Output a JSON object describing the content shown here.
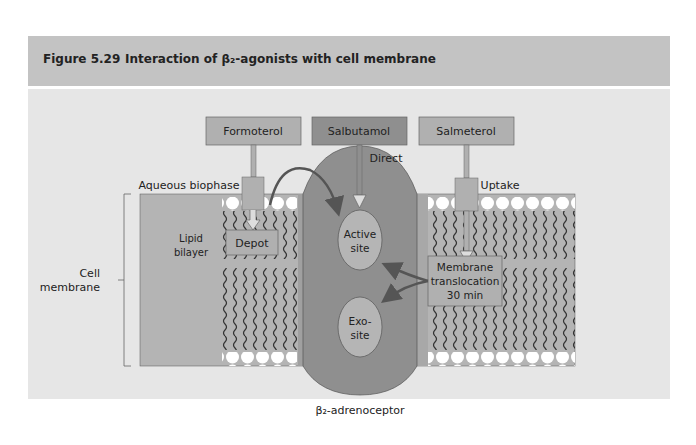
{
  "figure": {
    "number": "Figure 5.29",
    "title": "Interaction of β₂-agonists with cell membrane"
  },
  "diagram": {
    "drugs": [
      {
        "label": "Formoterol"
      },
      {
        "label": "Salbutamol"
      },
      {
        "label": "Salmeterol"
      }
    ],
    "labels": {
      "direct": "Direct",
      "uptake": "Uptake",
      "aqueous_biophase": "Aqueous biophase",
      "lipid": "Lipid",
      "bilayer": "bilayer",
      "depot": "Depot",
      "active_1": "Active",
      "active_2": "site",
      "exo_1": "Exo-",
      "exo_2": "site",
      "membrane_1": "Membrane",
      "membrane_2": "translocation",
      "membrane_3": "30 min",
      "cell_1": "Cell",
      "cell_2": "membrane",
      "receptor": "β₂-adrenoceptor"
    },
    "colors": {
      "header": "#c3c3c3",
      "panel": "#e6e6e6",
      "membrane": "#b4b4b4",
      "receptor": "#8f8f8f",
      "salbutamol_box": "#8f8f8f",
      "drug_box": "#b0b0b0",
      "site": "#b5b5b5",
      "arrow": "#555555"
    }
  }
}
